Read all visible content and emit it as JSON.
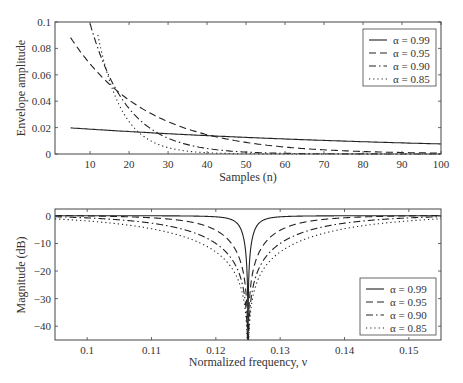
{
  "chart_data": [
    {
      "type": "line",
      "title": "",
      "xlabel": "Samples (n)",
      "ylabel": "Envelope amplitude",
      "xlim": [
        1,
        100
      ],
      "ylim": [
        0,
        0.1
      ],
      "xticks": [
        10,
        20,
        30,
        40,
        50,
        60,
        70,
        80,
        90,
        100
      ],
      "xtick_labels": [
        "10",
        "20",
        "30",
        "40",
        "50",
        "60",
        "70",
        "80",
        "90",
        "100"
      ],
      "yticks": [
        0,
        0.02,
        0.04,
        0.06,
        0.08,
        0.1
      ],
      "ytick_labels": [
        "0",
        "0.02",
        "0.04",
        "0.06",
        "0.08",
        "0.1"
      ],
      "grid": false,
      "legend_position": "upper right",
      "x": [
        5,
        10,
        15,
        20,
        25,
        30,
        40,
        50,
        60,
        70,
        80,
        90,
        100
      ],
      "series": [
        {
          "name": "α = 0.99",
          "style": "solid",
          "values": [
            0.0198,
            0.0189,
            0.018,
            0.0171,
            0.0163,
            0.0155,
            0.014,
            0.0127,
            0.0115,
            0.0104,
            0.0094,
            0.0085,
            0.0077
          ]
        },
        {
          "name": "α = 0.95",
          "style": "dashed",
          "values": [
            0.088,
            0.068,
            0.0526,
            0.0407,
            0.0315,
            0.0243,
            0.0146,
            0.0087,
            0.0052,
            0.0031,
            0.0019,
            0.0011,
            0.0007
          ]
        },
        {
          "name": "α = 0.90",
          "style": "dashdot",
          "values": [
            null,
            0.1,
            0.059,
            0.035,
            0.0205,
            0.0121,
            0.0042,
            0.0015,
            0.0005,
            0.0002,
            0.0001,
            0.0,
            0.0
          ]
        },
        {
          "name": "α = 0.85",
          "style": "dotted",
          "values": [
            null,
            null,
            0.055,
            0.024,
            0.0107,
            0.0047,
            0.0009,
            0.0002,
            0.0,
            0.0,
            0.0,
            0.0,
            0.0
          ]
        }
      ]
    },
    {
      "type": "line",
      "title": "",
      "xlabel": "Normalized frequency, ν",
      "ylabel": "Magnitude (dB)",
      "xlim": [
        0.095,
        0.155
      ],
      "ylim": [
        -45,
        2.5
      ],
      "xticks": [
        0.1,
        0.11,
        0.12,
        0.13,
        0.14,
        0.15
      ],
      "xtick_labels": [
        "0.1",
        "0.11",
        "0.12",
        "0.13",
        "0.14",
        "0.15"
      ],
      "yticks": [
        0,
        -10,
        -20,
        -30,
        -40
      ],
      "ytick_labels": [
        "0",
        "−10",
        "−20",
        "−30",
        "−40"
      ],
      "grid": false,
      "legend_position": "lower right",
      "notch_frequency": 0.125,
      "series": [
        {
          "name": "α = 0.99",
          "style": "solid",
          "alpha": 0.99
        },
        {
          "name": "α = 0.95",
          "style": "dashed",
          "alpha": 0.95
        },
        {
          "name": "α = 0.90",
          "style": "dashdot",
          "alpha": 0.9
        },
        {
          "name": "α = 0.85",
          "style": "dotted",
          "alpha": 0.85
        }
      ]
    }
  ],
  "legend": {
    "items": [
      "α = 0.99",
      "α = 0.95",
      "α = 0.90",
      "α = 0.85"
    ]
  },
  "colors": {
    "line": "#222222",
    "axis": "#444444",
    "text": "#333333"
  }
}
